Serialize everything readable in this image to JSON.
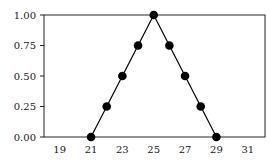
{
  "chart_data": {
    "type": "line",
    "title": "",
    "xlabel": "",
    "ylabel": "",
    "x": [
      21,
      22,
      23,
      24,
      25,
      26,
      27,
      28,
      29
    ],
    "series": [
      {
        "name": "triangular membership",
        "values": [
          0,
          0.25,
          0.5,
          0.75,
          1.0,
          0.75,
          0.5,
          0.25,
          0
        ]
      }
    ],
    "xlim": [
      18,
      32.1
    ],
    "ylim": [
      0,
      1.0
    ],
    "xticks": [
      "19",
      "21",
      "23",
      "25",
      "27",
      "29",
      "31"
    ],
    "yticks": [
      "0.00",
      "0.25",
      "0.50",
      "0.75",
      "1.00"
    ],
    "grid": false,
    "legend": "none",
    "marker": "filled-circle",
    "color": "#000000"
  }
}
